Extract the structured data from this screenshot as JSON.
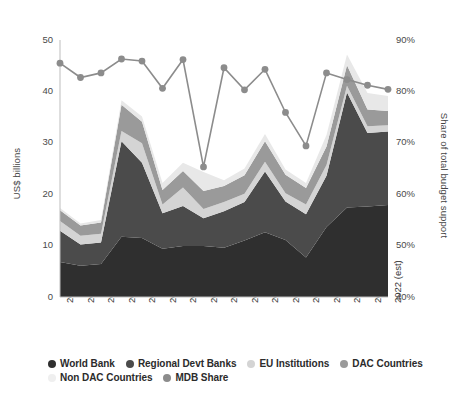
{
  "chart_data": {
    "type": "area",
    "title": "",
    "subtitle": "",
    "stacked": true,
    "grid": false,
    "legend_position": "bottom",
    "xlabel": "",
    "ylabel": "US$ billions",
    "y2label": "Share of total budget support",
    "ylim": [
      0,
      50
    ],
    "y2lim": [
      40,
      90
    ],
    "yticks": [
      "0",
      "10",
      "20",
      "30",
      "40",
      "50"
    ],
    "ytick_values": [
      0,
      10,
      20,
      30,
      40,
      50
    ],
    "y2ticks": [
      "40%",
      "50%",
      "60%",
      "70%",
      "80%",
      "90%"
    ],
    "y2tick_values": [
      40,
      50,
      60,
      70,
      80,
      90
    ],
    "categories": [
      "2006",
      "2007",
      "2008",
      "2009",
      "2010",
      "2011",
      "2012",
      "2013",
      "2014",
      "2015",
      "2016",
      "2017",
      "2018",
      "2019",
      "2020",
      "2021 (est)",
      "2022 (est)"
    ],
    "series": [
      {
        "name": "World Bank",
        "color": "#2f2f2f",
        "values": [
          6.8,
          6.1,
          6.4,
          11.7,
          11.5,
          9.4,
          9.9,
          9.9,
          9.6,
          11.0,
          12.6,
          11.1,
          7.7,
          13.6,
          17.4,
          17.6,
          17.9
        ]
      },
      {
        "name": "Regional Devt Banks",
        "color": "#4b4b4b",
        "values": [
          6.1,
          4.1,
          4.2,
          18.6,
          14.6,
          6.9,
          7.8,
          5.4,
          7.1,
          7.5,
          11.8,
          7.5,
          8.4,
          10.0,
          22.4,
          14.3,
          14.3
        ]
      },
      {
        "name": "EU Institutions",
        "color": "#d4d4d4",
        "values": [
          1.9,
          1.7,
          1.7,
          2.0,
          3.8,
          1.7,
          3.6,
          1.8,
          1.8,
          1.6,
          1.9,
          1.6,
          1.9,
          2.1,
          1.3,
          1.3,
          1.2
        ]
      },
      {
        "name": "DAC Countries",
        "color": "#9a9a9a",
        "values": [
          2.1,
          2.0,
          2.2,
          5.1,
          4.2,
          2.8,
          3.2,
          3.5,
          3.1,
          3.6,
          4.0,
          3.6,
          3.2,
          3.6,
          4.0,
          3.3,
          2.8
        ]
      },
      {
        "name": "Non DAC Countries",
        "color": "#e8e8e8",
        "values": [
          0.4,
          0.4,
          0.5,
          0.9,
          1.0,
          1.4,
          1.6,
          3.7,
          1.1,
          1.3,
          1.4,
          1.0,
          1.0,
          2.2,
          2.1,
          3.2,
          2.9
        ]
      }
    ],
    "line_series": {
      "name": "MDB Share",
      "color": "#8c8c8c",
      "axis": "right",
      "unit": "%",
      "values": [
        85.5,
        82.7,
        83.6,
        86.3,
        85.9,
        80.6,
        86.2,
        65.3,
        84.6,
        80.3,
        84.3,
        75.9,
        69.4,
        83.6,
        82.3,
        81.2,
        80.4
      ]
    }
  },
  "legend": {
    "items": [
      {
        "label": "World Bank",
        "color": "#2f2f2f"
      },
      {
        "label": "Regional Devt Banks",
        "color": "#4b4b4b"
      },
      {
        "label": "EU Institutions",
        "color": "#d4d4d4"
      },
      {
        "label": "DAC Countries",
        "color": "#9a9a9a"
      },
      {
        "label": "Non DAC Countries",
        "color": "#efefef"
      },
      {
        "label": "MDB Share",
        "color": "#8c8c8c"
      }
    ]
  }
}
